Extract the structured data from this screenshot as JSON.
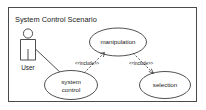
{
  "diagram": {
    "kind": "uml-use-case-diagram",
    "boundary": {
      "title": "System Control Scenario"
    },
    "actors": [
      {
        "id": "user",
        "label": "User",
        "icon": "actor-stick-figure-icon"
      }
    ],
    "use_cases": [
      {
        "id": "system-control",
        "label_line1": "system",
        "label_line2": "control"
      },
      {
        "id": "manipulation",
        "label": "manipulation"
      },
      {
        "id": "selection",
        "label": "selection"
      }
    ],
    "relationships": [
      {
        "id": "user-to-system-control",
        "type": "association",
        "from": "user",
        "to": "system-control",
        "label": ""
      },
      {
        "id": "system-control-includes-manipulation",
        "type": "include",
        "from": "system-control",
        "to": "manipulation",
        "label": "<<include>>"
      },
      {
        "id": "manipulation-includes-selection",
        "type": "include",
        "from": "manipulation",
        "to": "selection",
        "label": "<<include>>"
      }
    ],
    "colors": {
      "background": "#ffffff",
      "stroke": "#3c3c3c",
      "boundary_stroke": "#4a4a4a",
      "text": "#1a1a1a"
    }
  }
}
